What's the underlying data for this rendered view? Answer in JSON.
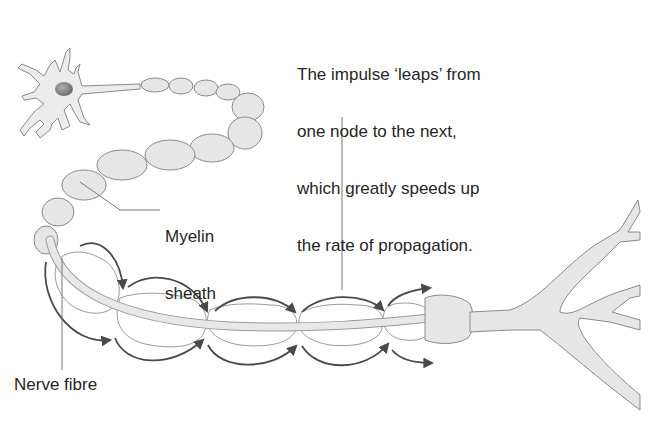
{
  "diagram": {
    "labels": {
      "impulse_line1": "The impulse ‘leaps’ from",
      "impulse_line2": "one node to the next,",
      "impulse_line3": "which greatly speeds up",
      "impulse_line4": "the rate of propagation.",
      "myelin_line1": "Myelin",
      "myelin_line2": "sheath",
      "nerve_fibre": "Nerve fibre"
    },
    "colors": {
      "fill": "#e8e8e8",
      "outline": "#8a8a8a",
      "arrow": "#4a4a4a",
      "nucleus": "#8c8c8c",
      "text": "#262626"
    }
  }
}
